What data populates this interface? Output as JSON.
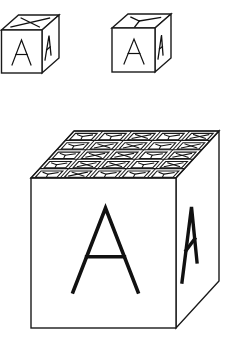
{
  "diagram": {
    "type": "cube-net-puzzle",
    "background": "#ffffff",
    "stroke_color": "#1a1a1a",
    "small_cubes": [
      {
        "id": "cube-1",
        "top_symbol": "X",
        "front_symbol": "A",
        "right_symbol": "A"
      },
      {
        "id": "cube-2",
        "top_symbol": "Y",
        "front_symbol": "A",
        "right_symbol": "A"
      }
    ],
    "large_cube": {
      "front_symbol": "A",
      "right_symbol": "A",
      "top_grid_rows": 5,
      "top_grid_cols": 5,
      "top_grid": [
        [
          "Y",
          "Y",
          "X",
          "Y",
          "X"
        ],
        [
          "Y",
          "X",
          "X",
          "Y",
          "X"
        ],
        [
          "Y",
          "X",
          "X",
          "Y",
          "X"
        ],
        [
          "Y",
          "X",
          "X",
          "Y",
          "X"
        ],
        [
          "Y",
          "X",
          "Y",
          "Y",
          "Y"
        ]
      ]
    }
  }
}
